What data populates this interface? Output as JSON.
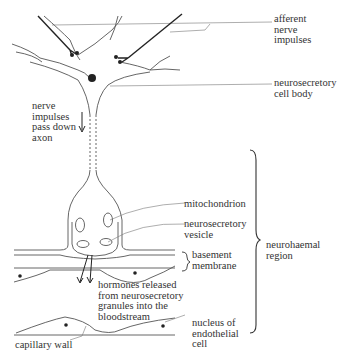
{
  "diagram": {
    "colors": {
      "ink": "#222222",
      "line": "#555555",
      "leader": "#777777",
      "text": "#333333",
      "background": "#ffffff"
    },
    "labels": {
      "afferent": "afferent\nnerve\nimpulses",
      "cell_body": "neurosecretory\ncell body",
      "nerve_impulses": "nerve\nimpulses\npass down\naxon",
      "mitochondrion": "mitochondrion",
      "vesicle": "neurosecretory\nvesicle",
      "basement": "basement\nmembrane",
      "neurohaemal": "neurohaemal\nregion",
      "hormones": "hormones released\nfrom neurosecretory\ngranules into the\nbloodstream",
      "nucleus": "nucleus of\nendothelial\ncell",
      "capillary": "capillary wall"
    }
  }
}
